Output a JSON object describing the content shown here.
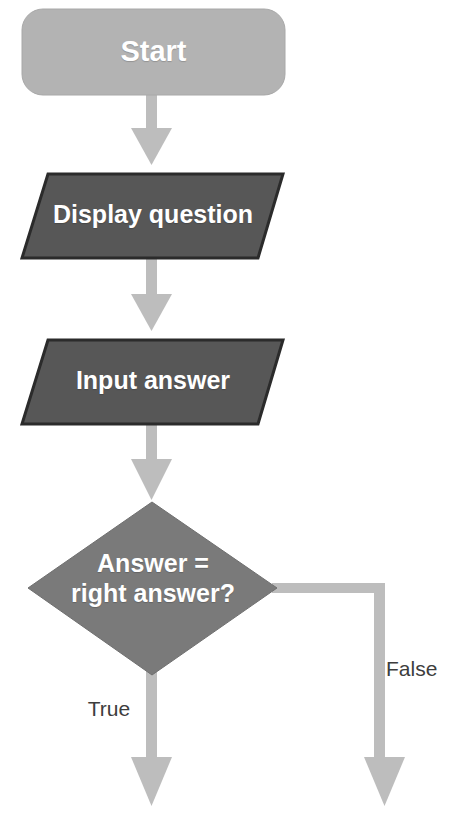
{
  "diagram": {
    "type": "flowchart",
    "canvas": {
      "width": 456,
      "height": 819,
      "background": "#ffffff"
    },
    "palette": {
      "terminator_fill": "#b3b3b3",
      "io_fill": "#575757",
      "decision_fill": "#7a7a7a",
      "shape_outline": "#2b2b2b",
      "connector": "#bdbdbd",
      "node_text": "#ffffff",
      "edge_text": "#3d3d3d"
    },
    "nodes": [
      {
        "id": "start",
        "label": "Start",
        "shape": "rounded-rectangle",
        "role": "terminator",
        "fill": "#b3b3b3"
      },
      {
        "id": "display-question",
        "label": "Display question",
        "shape": "parallelogram",
        "role": "input-output",
        "fill": "#575757"
      },
      {
        "id": "input-answer",
        "label": "Input answer",
        "shape": "parallelogram",
        "role": "input-output",
        "fill": "#575757"
      },
      {
        "id": "decision",
        "label": "Answer =\nright answer?",
        "line1": "Answer =",
        "line2": "right answer?",
        "shape": "diamond",
        "role": "decision",
        "fill": "#7a7a7a"
      }
    ],
    "edges": [
      {
        "id": "start-to-display",
        "from": "start",
        "to": "display-question",
        "label": "",
        "style": "arrow-down"
      },
      {
        "id": "display-to-input",
        "from": "display-question",
        "to": "input-answer",
        "label": "",
        "style": "arrow-down"
      },
      {
        "id": "input-to-decision",
        "from": "input-answer",
        "to": "decision",
        "label": "",
        "style": "arrow-down"
      },
      {
        "id": "decision-true",
        "from": "decision",
        "to": "",
        "label": "True",
        "style": "arrow-down"
      },
      {
        "id": "decision-false",
        "from": "decision",
        "to": "",
        "label": "False",
        "style": "elbow-right-down"
      }
    ]
  }
}
